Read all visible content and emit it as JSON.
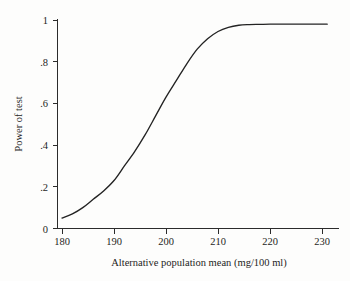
{
  "chart_data": {
    "type": "line",
    "title": "",
    "xlabel": "Alternative population mean (mg/100 ml)",
    "ylabel": "Power of test",
    "xlim": [
      178,
      232
    ],
    "ylim": [
      0,
      1.03
    ],
    "grid": false,
    "legend": null,
    "xticks": [
      180,
      190,
      200,
      210,
      220,
      230
    ],
    "xtick_labels": [
      "180",
      "190",
      "200",
      "210",
      "220",
      "230"
    ],
    "yticks": [
      0,
      0.2,
      0.4,
      0.6,
      0.8,
      1
    ],
    "ytick_labels": [
      "0",
      ".2",
      ".4",
      ".6",
      ".8",
      "1"
    ],
    "series": [
      {
        "name": "Power curve",
        "color": "#232323",
        "x": [
          180,
          182,
          184,
          186,
          188,
          190,
          192,
          194,
          196,
          198,
          200,
          202,
          204,
          206,
          208,
          210,
          212,
          214,
          216,
          218,
          220,
          222,
          224,
          226,
          228,
          230,
          231
        ],
        "y": [
          0.05,
          0.07,
          0.1,
          0.14,
          0.18,
          0.23,
          0.3,
          0.37,
          0.45,
          0.54,
          0.63,
          0.71,
          0.79,
          0.86,
          0.91,
          0.945,
          0.965,
          0.975,
          0.978,
          0.979,
          0.98,
          0.98,
          0.98,
          0.98,
          0.98,
          0.98,
          0.98
        ]
      }
    ]
  },
  "axes": {
    "x_title": "Alternative population mean (mg/100 ml)",
    "y_title": "Power of test"
  },
  "ticks": {
    "x": [
      "180",
      "190",
      "200",
      "210",
      "220",
      "230"
    ],
    "y": [
      "1",
      ".8",
      ".6",
      ".4",
      ".2",
      "0"
    ]
  }
}
